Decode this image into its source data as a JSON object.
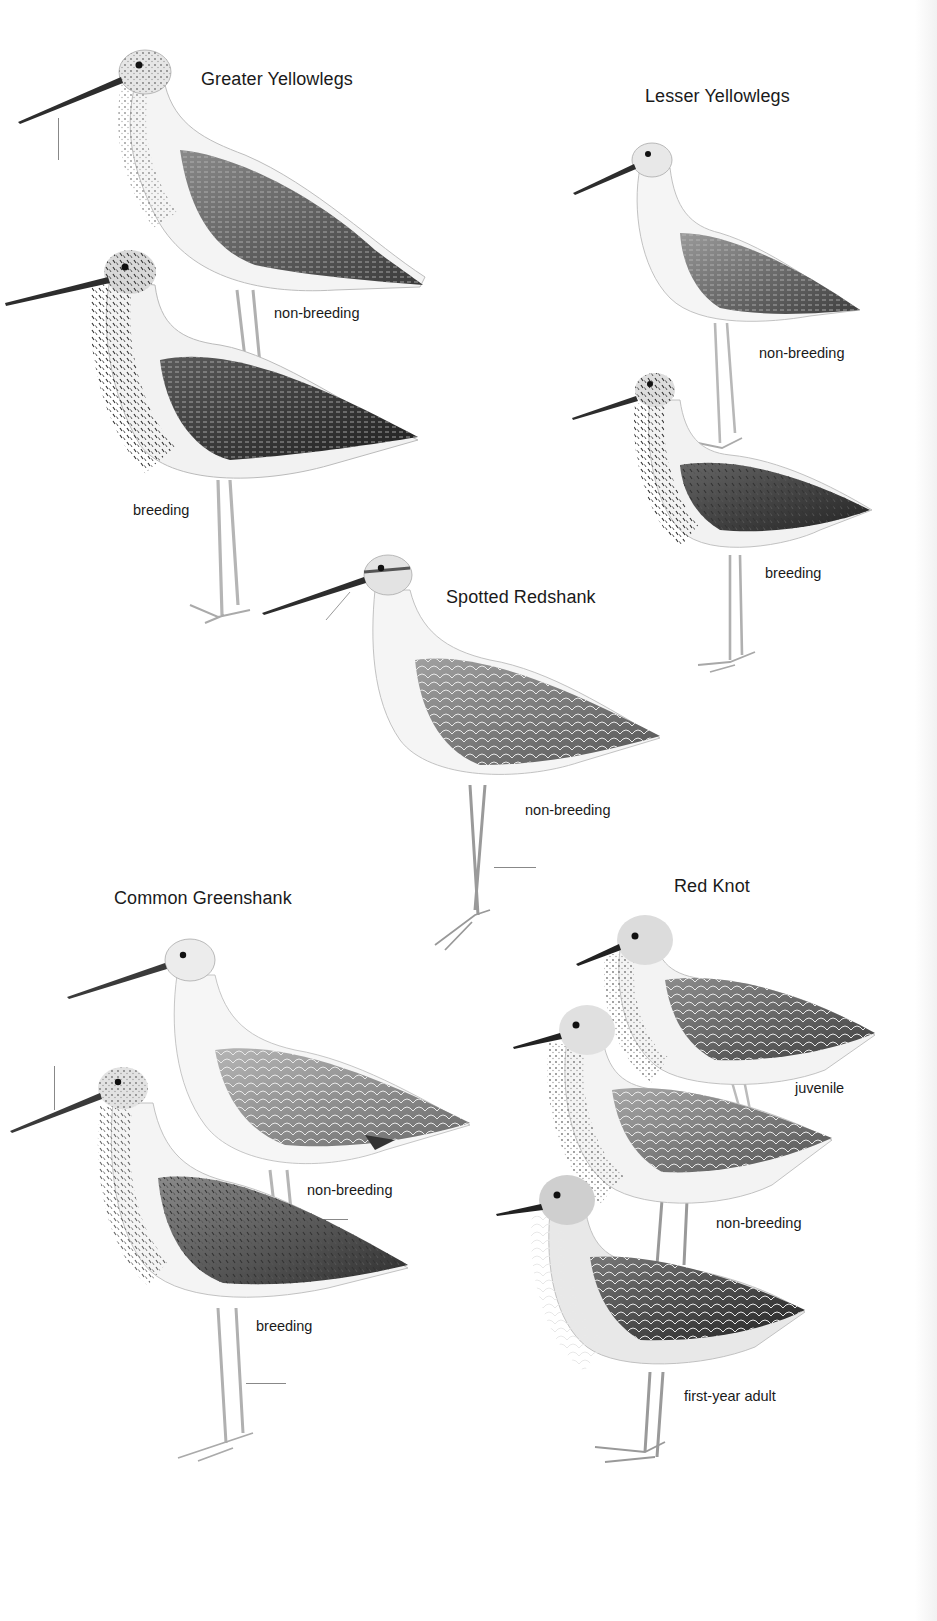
{
  "page": {
    "type": "field guide plate",
    "species": [
      {
        "name": "Greater Yellowlegs",
        "plumages": [
          "non-breeding",
          "breeding"
        ]
      },
      {
        "name": "Lesser Yellowlegs",
        "plumages": [
          "non-breeding",
          "breeding"
        ]
      },
      {
        "name": "Spotted Redshank",
        "plumages": [
          "non-breeding"
        ]
      },
      {
        "name": "Common Greenshank",
        "plumages": [
          "non-breeding",
          "breeding"
        ]
      },
      {
        "name": "Red Knot",
        "plumages": [
          "juvenile",
          "non-breeding",
          "first-year adult"
        ]
      }
    ]
  },
  "colors": {
    "background": "#ffffff",
    "text": "#1a1a1a",
    "ink_dark": "#2b2b2b",
    "ink_mid": "#7a7a7a",
    "ink_light": "#c8c8c8"
  }
}
